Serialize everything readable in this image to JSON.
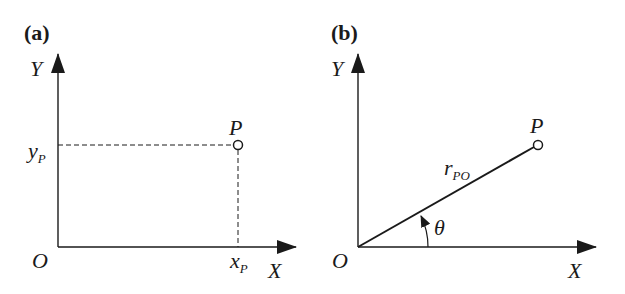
{
  "panels": [
    {
      "id": "a",
      "label": "(a)",
      "title": "Cartesian coordinates",
      "axis_x": "X",
      "axis_y": "Y",
      "origin": "O",
      "point": "P",
      "x_coord_main": "x",
      "x_coord_sub": "P",
      "y_coord_main": "y",
      "y_coord_sub": "P"
    },
    {
      "id": "b",
      "label": "(b)",
      "title": "Polar coordinates",
      "axis_x": "X",
      "axis_y": "Y",
      "origin": "O",
      "point": "P",
      "radius_main": "r",
      "radius_sub": "PO",
      "angle": "θ"
    }
  ],
  "colors": {
    "ink": "#1a1a1a",
    "background": "#ffffff"
  }
}
